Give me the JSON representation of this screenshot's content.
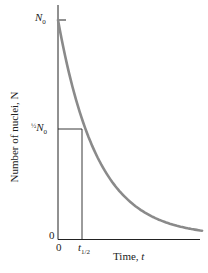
{
  "chart_data": {
    "type": "line",
    "title": "",
    "xlabel": "Time, t",
    "ylabel": "Number of nuclei, N",
    "y_ticks": [
      "N0",
      "1/2 N0",
      "0"
    ],
    "x_ticks": [
      "0",
      "t1/2"
    ],
    "series": [
      {
        "name": "N(t) = N0 e^(-λt)",
        "x": [
          0,
          0.5,
          1,
          1.5,
          2,
          3,
          4,
          5,
          5.3
        ],
        "values": [
          1.0,
          0.707,
          0.5,
          0.354,
          0.25,
          0.125,
          0.0625,
          0.031,
          0.025
        ]
      }
    ],
    "x_units": "half-lives",
    "grid": false,
    "legend": "none",
    "annotations": [
      "half-life guide lines at (t1/2, 1/2 N0)"
    ],
    "colors": {
      "curve": "#8a8a8a",
      "axes": "#222222"
    }
  },
  "labels": {
    "n0": "N",
    "n0_sub": "0",
    "half": "½",
    "half_n": "N",
    "half_sub": "0",
    "zero_y": "0",
    "zero_x": "0",
    "t": "t",
    "t_sub": "1/2",
    "xlabel_text": "Time, ",
    "xlabel_var": "t",
    "ylabel_text": "Number of nuclei, N"
  }
}
